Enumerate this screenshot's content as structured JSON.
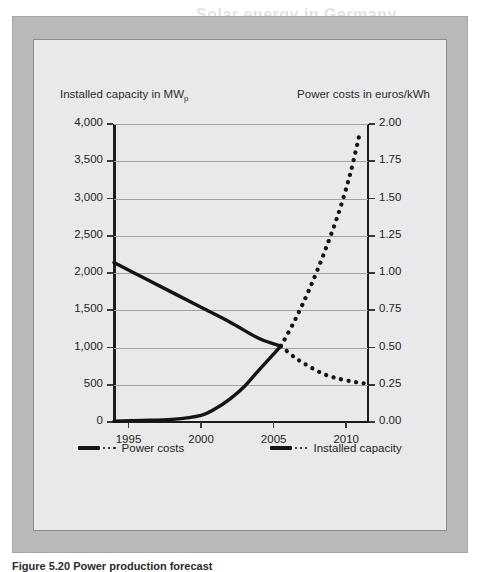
{
  "ghost_title": "Solar energy in Germany",
  "figure": {
    "caption": "Figure 5.20 Power production forecast",
    "frame_color": "#b9b9b9",
    "panel_color": "#e9e9e9"
  },
  "chart_data": {
    "type": "line",
    "title": "",
    "subtitle": "",
    "xlabel": "",
    "ylabel": "Installed capacity in MWp",
    "ylabel_right": "Power costs in euros/kWh",
    "grid": true,
    "legend_position": "bottom",
    "xlim": [
      1994,
      2011.5
    ],
    "xticks": [
      "1995",
      "2000",
      "2005",
      "2010"
    ],
    "xtick_values": [
      1995,
      2000,
      2005,
      2010
    ],
    "ylim": [
      0,
      4000
    ],
    "yticks": [
      "0",
      "500",
      "1,000",
      "1,500",
      "2,000",
      "2,500",
      "3,000",
      "3,500",
      "4,000"
    ],
    "ytick_values": [
      0,
      500,
      1000,
      1500,
      2000,
      2500,
      3000,
      3500,
      4000
    ],
    "ylim_right": [
      0.0,
      2.0
    ],
    "yticks_right": [
      "0.00",
      "0.25",
      "0.50",
      "0.75",
      "1.00",
      "1.25",
      "1.50",
      "1.75",
      "2.00"
    ],
    "ytick_values_right": [
      0.0,
      0.25,
      0.5,
      0.75,
      1.0,
      1.25,
      1.5,
      1.75,
      2.0
    ],
    "series": [
      {
        "name": "Power costs",
        "axis": "right",
        "style": "solid",
        "segment": "historical",
        "color": "#141414",
        "x": [
          1994,
          1996,
          1998,
          2000,
          2002,
          2004,
          2005.5
        ],
        "values": [
          1.07,
          0.97,
          0.87,
          0.77,
          0.67,
          0.56,
          0.51
        ]
      },
      {
        "name": "Power costs",
        "axis": "right",
        "style": "dotted",
        "segment": "forecast",
        "color": "#141414",
        "x": [
          2005.5,
          2006.5,
          2007.5,
          2008.5,
          2009.5,
          2010.5,
          2011.2
        ],
        "values": [
          0.51,
          0.43,
          0.37,
          0.32,
          0.29,
          0.27,
          0.26
        ]
      },
      {
        "name": "Installed capacity",
        "axis": "left",
        "style": "solid",
        "segment": "historical",
        "color": "#141414",
        "x": [
          1994,
          1996,
          1998,
          2000,
          2001,
          2002,
          2003,
          2004,
          2005.5
        ],
        "values": [
          10,
          20,
          35,
          90,
          180,
          310,
          480,
          700,
          1020
        ]
      },
      {
        "name": "Installed capacity",
        "axis": "left",
        "style": "dotted",
        "segment": "forecast",
        "color": "#141414",
        "x": [
          2005.5,
          2006.5,
          2007.5,
          2008.5,
          2009.5,
          2010.3,
          2010.9
        ],
        "values": [
          1020,
          1380,
          1800,
          2280,
          2820,
          3350,
          3850
        ]
      }
    ],
    "annotations": [
      {
        "text": "crossover",
        "x": 2005.5,
        "y_left": 1020,
        "y_right": 0.51
      }
    ]
  },
  "legend": {
    "items": [
      {
        "label": "Power costs",
        "marker": "solid-bar-with-dots"
      },
      {
        "label": "Installed capacity",
        "marker": "solid-bar-with-dots"
      }
    ]
  }
}
